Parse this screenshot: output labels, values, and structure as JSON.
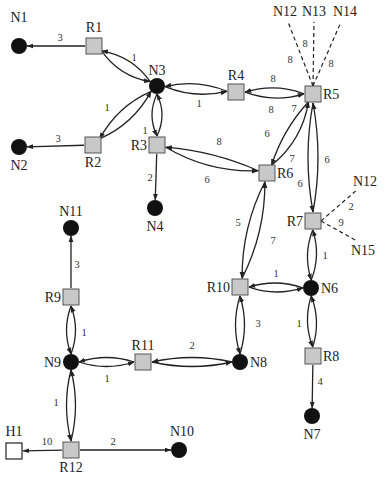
{
  "diagram": {
    "type": "network-topology",
    "nodes": {
      "N1": {
        "label": "N1",
        "kind": "host",
        "x": 19,
        "y": 46,
        "lx": 19,
        "ly": 22,
        "anchor": "middle"
      },
      "R1": {
        "label": "R1",
        "kind": "router",
        "x": 94,
        "y": 46,
        "lx": 94,
        "ly": 32,
        "anchor": "middle"
      },
      "N3": {
        "label": "N3",
        "kind": "host",
        "x": 157,
        "y": 86,
        "lx": 157,
        "ly": 75,
        "anchor": "middle"
      },
      "R4": {
        "label": "R4",
        "kind": "router",
        "x": 236,
        "y": 92,
        "lx": 236,
        "ly": 80,
        "anchor": "middle"
      },
      "R5": {
        "label": "R5",
        "kind": "router",
        "x": 313,
        "y": 94,
        "lx": 323,
        "ly": 99,
        "anchor": "start"
      },
      "R2": {
        "label": "R2",
        "kind": "router",
        "x": 93,
        "y": 145,
        "lx": 93,
        "ly": 167,
        "anchor": "middle"
      },
      "N2": {
        "label": "N2",
        "kind": "host",
        "x": 19,
        "y": 147,
        "lx": 19,
        "ly": 170,
        "anchor": "middle"
      },
      "R3": {
        "label": "R3",
        "kind": "router",
        "x": 157,
        "y": 145,
        "lx": 147,
        "ly": 150,
        "anchor": "end"
      },
      "N4": {
        "label": "N4",
        "kind": "host",
        "x": 155,
        "y": 208,
        "lx": 155,
        "ly": 231,
        "anchor": "middle"
      },
      "R6": {
        "label": "R6",
        "kind": "router",
        "x": 267,
        "y": 173,
        "lx": 277,
        "ly": 178,
        "anchor": "start"
      },
      "R7": {
        "label": "R7",
        "kind": "router",
        "x": 313,
        "y": 221,
        "lx": 303,
        "ly": 226,
        "anchor": "end"
      },
      "R10": {
        "label": "R10",
        "kind": "router",
        "x": 240,
        "y": 287,
        "lx": 230,
        "ly": 292,
        "anchor": "end"
      },
      "N6": {
        "label": "N6",
        "kind": "host",
        "x": 311,
        "y": 288,
        "lx": 321,
        "ly": 293,
        "anchor": "start"
      },
      "N8": {
        "label": "N8",
        "kind": "host",
        "x": 240,
        "y": 362,
        "lx": 250,
        "ly": 367,
        "anchor": "start"
      },
      "R8": {
        "label": "R8",
        "kind": "router",
        "x": 313,
        "y": 356,
        "lx": 323,
        "ly": 361,
        "anchor": "start"
      },
      "N7": {
        "label": "N7",
        "kind": "host",
        "x": 312,
        "y": 416,
        "lx": 312,
        "ly": 439,
        "anchor": "middle"
      },
      "N11": {
        "label": "N11",
        "kind": "host",
        "x": 71,
        "y": 228,
        "lx": 71,
        "ly": 216,
        "anchor": "middle"
      },
      "R9": {
        "label": "R9",
        "kind": "router",
        "x": 71,
        "y": 297,
        "lx": 61,
        "ly": 302,
        "anchor": "end"
      },
      "N9": {
        "label": "N9",
        "kind": "host",
        "x": 71,
        "y": 362,
        "lx": 61,
        "ly": 367,
        "anchor": "end"
      },
      "R11": {
        "label": "R11",
        "kind": "router",
        "x": 143,
        "y": 362,
        "lx": 143,
        "ly": 350,
        "anchor": "middle"
      },
      "R12": {
        "label": "R12",
        "kind": "router",
        "x": 71,
        "y": 450,
        "lx": 71,
        "ly": 472,
        "anchor": "middle"
      },
      "H1": {
        "label": "H1",
        "kind": "external",
        "x": 14,
        "y": 451,
        "lx": 14,
        "ly": 436,
        "anchor": "middle"
      },
      "N10": {
        "label": "N10",
        "kind": "host",
        "x": 179,
        "y": 450,
        "lx": 182,
        "ly": 436,
        "anchor": "middle"
      },
      "N12a": {
        "label": "N12",
        "kind": "label",
        "x": 288,
        "y": 16,
        "lx": 285,
        "ly": 16,
        "anchor": "middle"
      },
      "N13": {
        "label": "N13",
        "kind": "label",
        "x": 314,
        "y": 16,
        "lx": 314,
        "ly": 16,
        "anchor": "middle"
      },
      "N14": {
        "label": "N14",
        "kind": "label",
        "x": 341,
        "y": 16,
        "lx": 345,
        "ly": 16,
        "anchor": "middle"
      },
      "N12b": {
        "label": "N12",
        "kind": "label",
        "x": 358,
        "y": 189,
        "lx": 365,
        "ly": 186,
        "anchor": "middle"
      },
      "N15": {
        "label": "N15",
        "kind": "label",
        "x": 357,
        "y": 241,
        "lx": 363,
        "ly": 255,
        "anchor": "middle"
      }
    },
    "edges": [
      {
        "from": "R1",
        "to": "N1",
        "weight": "3",
        "style": "straight",
        "lx": 60,
        "ly": 41
      },
      {
        "from": "R2",
        "to": "N2",
        "weight": "3",
        "style": "straight",
        "lx": 58,
        "ly": 142
      },
      {
        "from": "R1",
        "to": "N3",
        "weight": "1",
        "style": "curve",
        "bend": -12,
        "lx": 134,
        "ly": 61
      },
      {
        "from": "N3",
        "to": "R1",
        "weight": "",
        "style": "curve",
        "bend": -12
      },
      {
        "from": "N3",
        "to": "R2",
        "weight": "1",
        "style": "curve",
        "bend": -12,
        "lx": 107,
        "ly": 111
      },
      {
        "from": "R2",
        "to": "N3",
        "weight": "",
        "style": "curve",
        "bend": -12
      },
      {
        "from": "N3",
        "to": "R4",
        "weight": "",
        "style": "curve",
        "bend": -10
      },
      {
        "from": "R4",
        "to": "N3",
        "weight": "1",
        "style": "curve",
        "bend": -10,
        "lx": 199,
        "ly": 107
      },
      {
        "from": "N3",
        "to": "R3",
        "weight": "",
        "style": "curve",
        "bend": -10
      },
      {
        "from": "R3",
        "to": "N3",
        "weight": "1",
        "style": "curve",
        "bend": -10,
        "lx": 145,
        "ly": 134
      },
      {
        "from": "R4",
        "to": "R5",
        "weight": "8",
        "style": "curve",
        "bend": -10,
        "lx": 273,
        "ly": 82
      },
      {
        "from": "R5",
        "to": "R4",
        "weight": "8",
        "style": "curve",
        "bend": -10,
        "lx": 271,
        "ly": 113
      },
      {
        "from": "R3",
        "to": "R6",
        "weight": "8",
        "style": "curve",
        "bend": -14,
        "lx": 219,
        "ly": 145
      },
      {
        "from": "R6",
        "to": "R3",
        "weight": "6",
        "style": "curve",
        "bend": -8,
        "lx": 207,
        "ly": 183
      },
      {
        "from": "R3",
        "to": "N4",
        "weight": "2",
        "style": "straight",
        "lx": 150,
        "ly": 181
      },
      {
        "from": "R6",
        "to": "R5",
        "weight": "6",
        "style": "curve",
        "bend": -14,
        "lx": 267,
        "ly": 137
      },
      {
        "from": "R5",
        "to": "R6",
        "weight": "7",
        "style": "curve",
        "bend": -8,
        "lx": 292,
        "ly": 162,
        "extra_label": "7",
        "elx": 294,
        "ely": 112
      },
      {
        "from": "R5",
        "to": "R7",
        "weight": "6",
        "style": "curve",
        "bend": -10,
        "lx": 327,
        "ly": 163
      },
      {
        "from": "R7",
        "to": "R5",
        "weight": "6",
        "style": "curve",
        "bend": -10,
        "lx": 300,
        "ly": 187
      },
      {
        "from": "R10",
        "to": "R6",
        "weight": "5",
        "style": "curve",
        "bend": -12,
        "lx": 238,
        "ly": 226
      },
      {
        "from": "R6",
        "to": "R10",
        "weight": "7",
        "style": "curve",
        "bend": -12,
        "lx": 273,
        "ly": 244
      },
      {
        "from": "R7",
        "to": "N6",
        "weight": "1",
        "style": "curve",
        "bend": -9,
        "lx": 325,
        "ly": 259
      },
      {
        "from": "N6",
        "to": "R7",
        "weight": "",
        "style": "curve",
        "bend": -9
      },
      {
        "from": "R10",
        "to": "N6",
        "weight": "1",
        "style": "curve",
        "bend": -9,
        "lx": 276,
        "ly": 277
      },
      {
        "from": "N6",
        "to": "R10",
        "weight": "",
        "style": "curve",
        "bend": -9
      },
      {
        "from": "R10",
        "to": "N8",
        "weight": "3",
        "style": "curve",
        "bend": -9,
        "lx": 258,
        "ly": 327
      },
      {
        "from": "N8",
        "to": "R10",
        "weight": "",
        "style": "curve",
        "bend": -9
      },
      {
        "from": "N6",
        "to": "R8",
        "weight": "1",
        "style": "curve",
        "bend": -9,
        "lx": 299,
        "ly": 327
      },
      {
        "from": "R8",
        "to": "N6",
        "weight": "",
        "style": "curve",
        "bend": -9
      },
      {
        "from": "R8",
        "to": "N7",
        "weight": "4",
        "style": "straight",
        "lx": 320,
        "ly": 385
      },
      {
        "from": "R11",
        "to": "N8",
        "weight": "2",
        "style": "curve",
        "bend": -9,
        "lx": 192,
        "ly": 349
      },
      {
        "from": "N8",
        "to": "R11",
        "weight": "",
        "style": "curve",
        "bend": -9
      },
      {
        "from": "N9",
        "to": "R11",
        "weight": "",
        "style": "curve",
        "bend": -9
      },
      {
        "from": "R11",
        "to": "N9",
        "weight": "1",
        "style": "curve",
        "bend": -9,
        "lx": 107,
        "ly": 382
      },
      {
        "from": "R9",
        "to": "N11",
        "weight": "3",
        "style": "straight",
        "lx": 77,
        "ly": 268
      },
      {
        "from": "N9",
        "to": "R9",
        "weight": "",
        "style": "curve",
        "bend": -9
      },
      {
        "from": "R9",
        "to": "N9",
        "weight": "1",
        "style": "curve",
        "bend": -9,
        "lx": 84,
        "ly": 336
      },
      {
        "from": "N9",
        "to": "R12",
        "weight": "",
        "style": "curve",
        "bend": -9
      },
      {
        "from": "R12",
        "to": "N9",
        "weight": "1",
        "style": "curve",
        "bend": -9,
        "lx": 56,
        "ly": 406
      },
      {
        "from": "R12",
        "to": "H1",
        "weight": "10",
        "style": "straight",
        "lx": 47,
        "ly": 445
      },
      {
        "from": "R12",
        "to": "N10",
        "weight": "2",
        "style": "straight",
        "lx": 113,
        "ly": 445
      },
      {
        "from": "R5",
        "to": "N12a",
        "weight": "8",
        "style": "dashed",
        "lx": 290,
        "ly": 63
      },
      {
        "from": "R5",
        "to": "N13",
        "weight": "8",
        "style": "dashed",
        "lx": 305,
        "ly": 47
      },
      {
        "from": "R5",
        "to": "N14",
        "weight": "8",
        "style": "dashed",
        "lx": 331,
        "ly": 67
      },
      {
        "from": "R7",
        "to": "N12b",
        "weight": "2",
        "style": "dashed",
        "lx": 351,
        "ly": 210
      },
      {
        "from": "R7",
        "to": "N15",
        "weight": "9",
        "style": "dashed",
        "lx": 341,
        "ly": 226
      }
    ],
    "colors": {
      "router_fill": "#c8c8c8",
      "router_stroke": "#555555",
      "host_fill": "#111111",
      "external_fill": "#ffffff",
      "edge": "#222222"
    }
  }
}
